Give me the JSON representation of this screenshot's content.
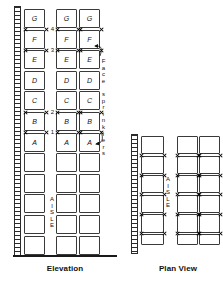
{
  "figure": {
    "type": "rack-storage-sprinkler-diagram",
    "views": [
      "Elevation",
      "Plan View"
    ],
    "captions": {
      "elevation": "Elevation",
      "plan_view": "Plan View"
    },
    "annotation": {
      "face_sprinklers_label": "Face sprinklers",
      "face_sprinklers_chars": [
        "F",
        "a",
        "c",
        "e",
        " ",
        "s",
        "p",
        "r",
        "i",
        "n",
        "k",
        "l",
        "e",
        "r",
        "s"
      ],
      "aisle_label": "AISLE",
      "aisle_chars": [
        "A",
        "I",
        "S",
        "L",
        "E"
      ]
    },
    "colors": {
      "line": "#3a3a3a",
      "wall": "#2b2b2b",
      "floor": "#1a1a1a",
      "background": "#ffffff",
      "text": "#111111"
    }
  },
  "elevation": {
    "tier_numbers": [
      "4",
      "3",
      "2",
      "1"
    ],
    "storage_level_labels": [
      "G",
      "F",
      "E",
      "D",
      "C",
      "B",
      "A"
    ],
    "rows_total": 12,
    "labeled_rows": 7,
    "unlabeled_rows": 5,
    "columns": 3,
    "column_1": {
      "name": "wall-adjacent-rack",
      "labels": [
        "G",
        "F",
        "E",
        "D",
        "C",
        "B",
        "A",
        "",
        "",
        "",
        "",
        ""
      ]
    },
    "column_2": {
      "name": "double-row-rack-left",
      "labels": [
        "G",
        "F",
        "E",
        "D",
        "C",
        "B",
        "A",
        "",
        "",
        "",
        "",
        ""
      ]
    },
    "column_3": {
      "name": "double-row-rack-right",
      "labels": [
        "G",
        "F",
        "E",
        "D",
        "C",
        "B",
        "A",
        "",
        "",
        "",
        "",
        ""
      ]
    },
    "sprinkler_rows": [
      1,
      2,
      5,
      6
    ],
    "sprinkler_count": 18
  },
  "plan_view": {
    "rows": 6,
    "left_rack_columns": 1,
    "right_rack_columns": 2,
    "aisle_label": "AISLE",
    "sprinkler_count": 16
  }
}
